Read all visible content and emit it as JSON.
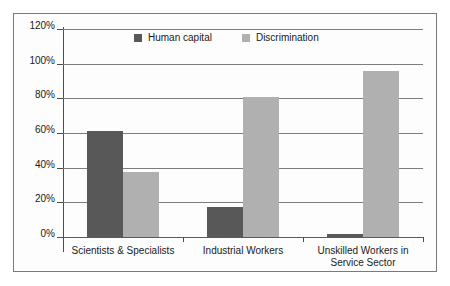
{
  "chart_data": {
    "type": "bar",
    "title": "",
    "subtitle": "",
    "xlabel": "",
    "ylabel": "",
    "categories": [
      "Scientists & Specialists",
      "Industrial Workers",
      "Unskilled Workers in\nService Sector"
    ],
    "category_lines": [
      [
        "Scientists & Specialists"
      ],
      [
        "Industrial Workers"
      ],
      [
        "Unskilled Workers in",
        "Service Sector"
      ]
    ],
    "series": [
      {
        "name": "Human capital",
        "color": "#585858",
        "values": [
          61,
          17.5,
          2
        ]
      },
      {
        "name": "Discrimination",
        "color": "#b0b0b0",
        "values": [
          37.5,
          81,
          95.5
        ]
      }
    ],
    "ylim": [
      0,
      120
    ],
    "ytick_step": 20,
    "ytick_labels": [
      "0%",
      "20%",
      "40%",
      "60%",
      "80%",
      "100%",
      "120%"
    ],
    "ytick_values": [
      0,
      20,
      40,
      60,
      80,
      100,
      120
    ],
    "grid": true,
    "legend_position": "top-center",
    "value_format": "percent"
  },
  "legend": {
    "items": [
      {
        "label": "Human capital",
        "swatch": "legend-swatch-human-capital"
      },
      {
        "label": "Discrimination",
        "swatch": "legend-swatch-discrimination"
      }
    ]
  },
  "colors": {
    "series_human_capital": "#585858",
    "series_discrimination": "#b0b0b0",
    "gridline": "#7d7d7d",
    "axis": "#4d4d4d",
    "frame_border": "#7a7a7a",
    "text": "#1a1a1a",
    "background": "#ffffff"
  }
}
